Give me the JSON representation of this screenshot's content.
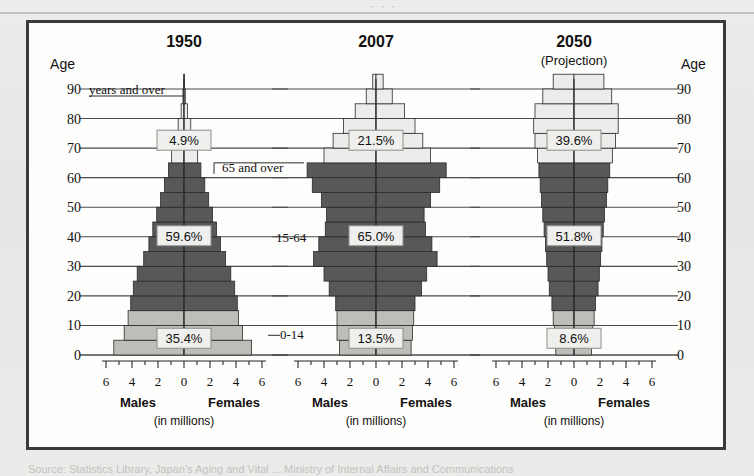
{
  "figure": {
    "top_cut_text": "· · ·",
    "bottom_caption_cut": "Source:   Statistics Library, Japan's Aging and Vital ... Ministry of Internal Affairs and Communications",
    "axis_label_left": "Age",
    "axis_label_right": "Age",
    "y_ticks": [
      90,
      80,
      70,
      60,
      50,
      40,
      30,
      20,
      10,
      0
    ],
    "x_ticks": [
      6,
      4,
      2,
      0,
      2,
      4,
      6
    ],
    "males_label": "Males",
    "females_label": "Females",
    "units_label": "(in millions)",
    "colors": {
      "old_fill": "#ececeb",
      "work_fill": "#585858",
      "young_fill": "#bdbdba",
      "outline": "#2b2b2b",
      "gridline": "#4a4a4a",
      "frame": "#3a3a3a",
      "page": "#e9e9e7",
      "panel": "#fdfdfc"
    }
  },
  "chart_data": {
    "type": "bar",
    "chart_kind": "population-pyramid",
    "xlabel": "(in millions)",
    "ylabel": "Age",
    "xlim": [
      -6,
      6
    ],
    "ylim": [
      0,
      90
    ],
    "x_tick_values": [
      6,
      4,
      2,
      0,
      2,
      4,
      6
    ],
    "y_tick_values": [
      0,
      10,
      20,
      30,
      40,
      50,
      60,
      70,
      80,
      90
    ],
    "grid": true,
    "legend": [
      "0-14",
      "15-64",
      "65 and over"
    ],
    "age_groups": [
      "0-4",
      "5-9",
      "10-14",
      "15-19",
      "20-24",
      "25-29",
      "30-34",
      "35-39",
      "40-44",
      "45-49",
      "50-54",
      "55-59",
      "60-64",
      "65-69",
      "70-74",
      "75-79",
      "80-84",
      "85-89",
      "90+"
    ],
    "panels": [
      {
        "name": "1950",
        "title": "1950",
        "subtitle": "",
        "shape": "expansive pyramid",
        "shares": {
          "young": "35.4%",
          "working": "59.6%",
          "old": "4.9%"
        },
        "share_values": {
          "young": 35.4,
          "working": 59.6,
          "old": 4.9
        },
        "males": [
          5.4,
          4.6,
          4.3,
          4.1,
          3.9,
          3.6,
          3.1,
          2.7,
          2.4,
          2.1,
          1.8,
          1.5,
          1.2,
          0.95,
          0.7,
          0.45,
          0.22,
          0.08,
          0.02
        ],
        "females": [
          5.2,
          4.5,
          4.2,
          4.1,
          3.9,
          3.6,
          3.2,
          2.8,
          2.5,
          2.2,
          1.9,
          1.6,
          1.3,
          1.05,
          0.8,
          0.52,
          0.27,
          0.1,
          0.03
        ]
      },
      {
        "name": "2007",
        "title": "2007",
        "subtitle": "",
        "shape": "constrictive with two bulges",
        "shares": {
          "young": "13.5%",
          "working": "65.0%",
          "old": "21.5%"
        },
        "share_values": {
          "young": 13.5,
          "working": 65.0,
          "old": 21.5
        },
        "males": [
          2.8,
          3.0,
          3.0,
          3.1,
          3.6,
          4.0,
          4.8,
          4.4,
          3.9,
          3.8,
          4.2,
          4.9,
          5.3,
          4.0,
          3.3,
          2.5,
          1.6,
          0.75,
          0.25
        ],
        "females": [
          2.7,
          2.8,
          2.9,
          3.0,
          3.5,
          3.9,
          4.7,
          4.3,
          3.8,
          3.7,
          4.2,
          4.9,
          5.4,
          4.2,
          3.6,
          3.0,
          2.2,
          1.25,
          0.55
        ]
      },
      {
        "name": "2050",
        "title": "2050",
        "subtitle": "(Projection)",
        "shape": "inverted, top-heavy",
        "shares": {
          "young": "8.6%",
          "working": "51.8%",
          "old": "39.6%"
        },
        "share_values": {
          "young": 8.6,
          "working": 51.8,
          "old": 39.6
        },
        "males": [
          1.4,
          1.5,
          1.6,
          1.7,
          1.9,
          2.0,
          2.1,
          2.2,
          2.3,
          2.4,
          2.5,
          2.6,
          2.7,
          2.8,
          3.0,
          3.1,
          3.0,
          2.4,
          1.6
        ],
        "females": [
          1.35,
          1.45,
          1.55,
          1.65,
          1.85,
          1.95,
          2.05,
          2.15,
          2.25,
          2.35,
          2.5,
          2.6,
          2.75,
          2.95,
          3.2,
          3.4,
          3.4,
          2.9,
          2.3
        ]
      }
    ],
    "annotations_1950": [
      {
        "text": "years and over",
        "for": "90"
      },
      {
        "text": "65 and over",
        "for": "old-band"
      },
      {
        "text": "15-64",
        "for": "working-band"
      },
      {
        "text": "0-14",
        "for": "young-band"
      }
    ]
  }
}
